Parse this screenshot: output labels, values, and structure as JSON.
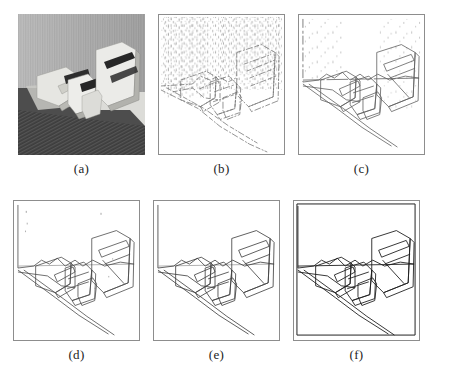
{
  "figure": {
    "kind": "multi-panel-figure",
    "layout": {
      "rows": 2,
      "columns": 3,
      "panel_width_px": 127,
      "panel_height_px": 141
    },
    "panels": [
      {
        "id": "a",
        "caption": "(a)",
        "type": "grayscale-photograph",
        "description": "Original grayscale photograph of polyhedral wedge blocks resting on a flat surface in front of a vertically striped textured wall, with strong cast shadows to the left and a dark hatched foreground.",
        "noise_level": "n/a",
        "edge_density": "n/a",
        "background": "striped-wall-texture"
      },
      {
        "id": "b",
        "caption": "(b)",
        "type": "edge-map",
        "description": "Very noisy edge map: object contours are fragmented and the background wall texture produces dense vertical speckle streaks across the upper half.",
        "noise_level": "high",
        "edge_density": "high",
        "stroke_color": "#6f6f6f"
      },
      {
        "id": "c",
        "caption": "(c)",
        "type": "edge-map",
        "description": "Moderately noisy edge map: object contours are largely continuous, some residual dotted texture noise remains in the upper background region.",
        "noise_level": "medium",
        "edge_density": "medium",
        "stroke_color": "#5e5e5e"
      },
      {
        "id": "d",
        "caption": "(d)",
        "type": "edge-map",
        "description": "Clean edge map: continuous object and shadow contours with only a few isolated noise specks in the upper left background.",
        "noise_level": "low",
        "edge_density": "low",
        "stroke_color": "#4a4a4a"
      },
      {
        "id": "e",
        "caption": "(e)",
        "type": "edge-map",
        "description": "Clean edge map with smooth continuous contours and essentially no background noise.",
        "noise_level": "very low",
        "edge_density": "low",
        "stroke_color": "#424242"
      },
      {
        "id": "f",
        "caption": "(f)",
        "type": "edge-map",
        "description": "Cleanest result: dark, fully continuous object, shadow and frame contours with no background noise.",
        "noise_level": "none",
        "edge_density": "low",
        "stroke_color": "#1f1f1f"
      }
    ]
  },
  "colors": {
    "page_background": "#ffffff",
    "caption_text": "#1d1d1d",
    "frame_border": "#8d8d8d"
  }
}
